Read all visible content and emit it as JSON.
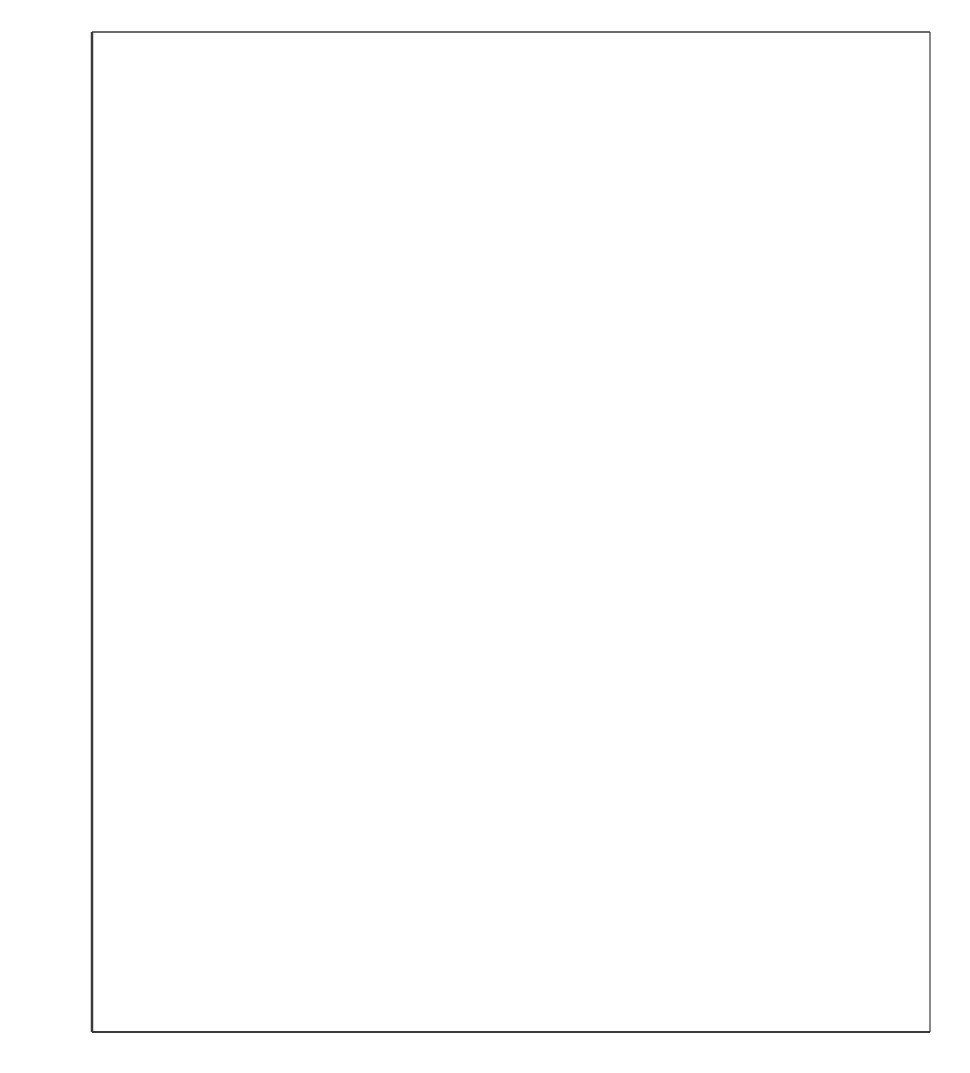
{
  "chart_data": {
    "type": "area",
    "title": "",
    "subtitle": "",
    "xlabel": "",
    "ylabel": "Rate per 100,000 population",
    "xlim": [
      1960,
      1982
    ],
    "ylim": [
      0,
      3200
    ],
    "ytick_values": [
      0,
      400,
      800,
      1200,
      1600,
      2000,
      2400,
      2800,
      3200
    ],
    "ytick_labels": [
      "0",
      "400",
      "800",
      "1200",
      "1600",
      "2000",
      "2400",
      "2800",
      "3200"
    ],
    "xtick_values": [
      1960,
      1965,
      1970,
      1975,
      1980,
      1982
    ],
    "xtick_labels": [
      "1960",
      "1965",
      "1970",
      "1975",
      "1980",
      "1982"
    ],
    "minor_xticks_every": 1,
    "grid": "major-xy",
    "legend": "inline-annotations",
    "stacked": true,
    "fill_color": "#d0d0d0",
    "line_color": "#000000",
    "background_color": "#ffffff",
    "x": [
      1960,
      1961,
      1962,
      1963,
      1964,
      1965,
      1966,
      1967,
      1968,
      1969,
      1970,
      1971,
      1972,
      1973,
      1974,
      1975,
      1976,
      1977,
      1978,
      1979,
      1980,
      1981,
      1982
    ],
    "series": [
      {
        "name": "Larceny-theft",
        "note": "upper boundary of stack (cumulative total of all three offenses)",
        "values": [
          1060,
          1055,
          1105,
          1190,
          1330,
          1335,
          1455,
          1605,
          1760,
          1900,
          2060,
          2130,
          1995,
          2060,
          2400,
          2810,
          2905,
          2720,
          2740,
          2910,
          3120,
          3060,
          2990
        ]
      },
      {
        "name": "Burglary",
        "note": "middle boundary of stack (cumulative burglary + motor vehicle theft)",
        "values": [
          515,
          535,
          555,
          600,
          650,
          690,
          720,
          825,
          900,
          940,
          1010,
          1185,
          1155,
          1230,
          1370,
          1530,
          1470,
          1420,
          1425,
          1520,
          1670,
          1630,
          1480
        ]
      },
      {
        "name": "Motor vehicle theft",
        "note": "lower band of stack",
        "values": [
          175,
          185,
          200,
          225,
          260,
          260,
          290,
          330,
          385,
          430,
          455,
          460,
          445,
          455,
          465,
          470,
          465,
          465,
          465,
          590,
          550,
          500,
          450
        ]
      }
    ],
    "annotations": [
      {
        "label": "Larceny-theft",
        "x": 1971.2,
        "y": 2570
      },
      {
        "label": "Burglary",
        "x": 1971.9,
        "y": 1450
      },
      {
        "label": "Motor vehicle theft",
        "x": 1970.3,
        "y": 565
      }
    ]
  },
  "axes": {
    "ylabel": "Rate per 100,000 population"
  }
}
